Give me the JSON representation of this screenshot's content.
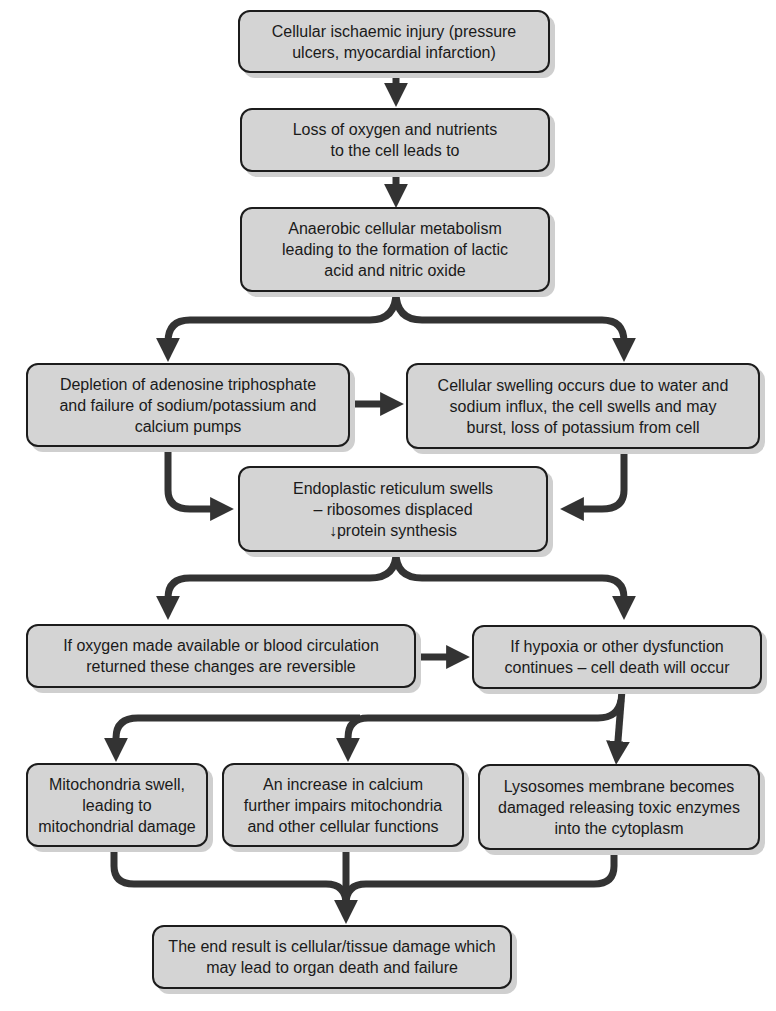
{
  "diagram": {
    "type": "flowchart",
    "colors": {
      "box_fill": "#d4d4d4",
      "box_border": "#1c1c1c",
      "arrow": "#333333",
      "shadow": "#cfcfcf"
    },
    "nodes": [
      {
        "id": "n1",
        "text": "Cellular ischaemic injury (pressure\nulcers, myocardial infarction)"
      },
      {
        "id": "n2",
        "text": "Loss of oxygen and nutrients\nto the cell leads to"
      },
      {
        "id": "n3",
        "text": "Anaerobic cellular metabolism\nleading to the formation of lactic\nacid and nitric oxide"
      },
      {
        "id": "n4",
        "text": "Depletion of adenosine triphosphate\nand failure of sodium/potassium and\ncalcium pumps"
      },
      {
        "id": "n5",
        "text": "Cellular swelling occurs due to water and\nsodium influx, the cell swells and may\nburst, loss of potassium from cell"
      },
      {
        "id": "n6",
        "text": "Endoplastic reticulum swells\n– ribosomes displaced\n↓protein synthesis"
      },
      {
        "id": "n7",
        "text": "If oxygen made available or blood circulation\nreturned these changes are reversible"
      },
      {
        "id": "n8",
        "text": "If hypoxia or other dysfunction\ncontinues – cell death will occur"
      },
      {
        "id": "n9",
        "text": "Mitochondria swell,\nleading to\nmitochondrial damage"
      },
      {
        "id": "n10",
        "text": "An increase in calcium\nfurther impairs mitochondria\nand other cellular functions"
      },
      {
        "id": "n11",
        "text": "Lysosomes membrane becomes\ndamaged releasing toxic enzymes\ninto the cytoplasm"
      },
      {
        "id": "n12",
        "text": "The end result is cellular/tissue damage which\nmay lead to organ death and failure"
      }
    ],
    "edges": [
      {
        "from": "n1",
        "to": "n2"
      },
      {
        "from": "n2",
        "to": "n3"
      },
      {
        "from": "n3",
        "to": "n4"
      },
      {
        "from": "n3",
        "to": "n5"
      },
      {
        "from": "n4",
        "to": "n5"
      },
      {
        "from": "n4",
        "to": "n6"
      },
      {
        "from": "n5",
        "to": "n6"
      },
      {
        "from": "n6",
        "to": "n7"
      },
      {
        "from": "n6",
        "to": "n8"
      },
      {
        "from": "n7",
        "to": "n8"
      },
      {
        "from": "n8",
        "to": "n9"
      },
      {
        "from": "n8",
        "to": "n10"
      },
      {
        "from": "n8",
        "to": "n11"
      },
      {
        "from": "n9",
        "to": "n12"
      },
      {
        "from": "n10",
        "to": "n12"
      },
      {
        "from": "n11",
        "to": "n12"
      }
    ]
  }
}
